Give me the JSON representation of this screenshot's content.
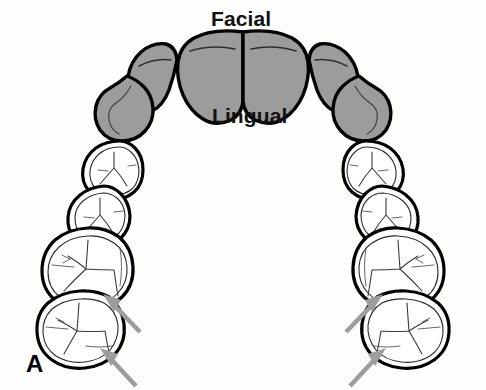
{
  "figure": {
    "panel_letter": "A",
    "background_color": "#fdfdfb",
    "width": 486,
    "height": 390
  },
  "labels": {
    "facial": "Facial",
    "lingual": "Lingual"
  },
  "colors": {
    "shaded_tooth_fill": "#9c9c9c",
    "unshaded_tooth_fill": "#ffffff",
    "outline": "#000000",
    "groove": "#3a3a3a",
    "arrow": "#9d9d9d",
    "text": "#121212"
  },
  "teeth": {
    "shaded_group_name": "anterior teeth",
    "unshaded_group_name": "posterior teeth",
    "left_quadrant": [
      {
        "name": "central-incisor",
        "shaded": true
      },
      {
        "name": "lateral-incisor",
        "shaded": true
      },
      {
        "name": "canine",
        "shaded": true
      },
      {
        "name": "first-premolar",
        "shaded": false
      },
      {
        "name": "second-premolar",
        "shaded": false
      },
      {
        "name": "first-molar",
        "shaded": false
      },
      {
        "name": "second-molar",
        "shaded": false
      }
    ],
    "right_quadrant": [
      {
        "name": "central-incisor",
        "shaded": true
      },
      {
        "name": "lateral-incisor",
        "shaded": true
      },
      {
        "name": "canine",
        "shaded": true
      },
      {
        "name": "first-premolar",
        "shaded": false
      },
      {
        "name": "second-premolar",
        "shaded": false
      },
      {
        "name": "first-molar",
        "shaded": false
      },
      {
        "name": "second-molar",
        "shaded": false
      }
    ]
  },
  "annotations": {
    "arrow_count": 4,
    "arrows": [
      {
        "name": "left-first-molar-arrow",
        "points_to": "first-molar",
        "side": "left"
      },
      {
        "name": "left-second-molar-arrow",
        "points_to": "second-molar",
        "side": "left"
      },
      {
        "name": "right-first-molar-arrow",
        "points_to": "first-molar",
        "side": "right"
      },
      {
        "name": "right-second-molar-arrow",
        "points_to": "second-molar",
        "side": "right"
      }
    ]
  }
}
